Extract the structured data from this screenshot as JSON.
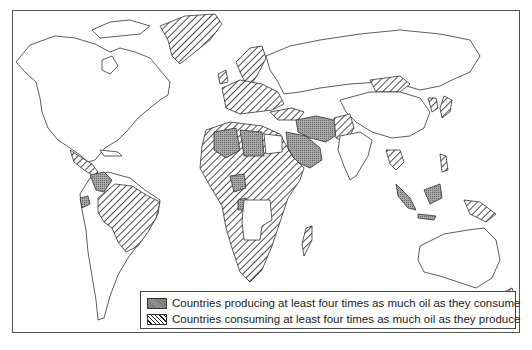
{
  "figure": {
    "type": "world-map",
    "style": "black-and-white outline map with pattern fills"
  },
  "legend": {
    "items": [
      {
        "id": "producer",
        "pattern": "dark-stipple",
        "color": "#9a9a9a",
        "label": "Countries producing at least four times as much oil as they consume"
      },
      {
        "id": "consumer",
        "pattern": "diagonal-hatch",
        "color": "#222222",
        "label": "Countries consuming at least four times as much oil as they produce"
      }
    ]
  },
  "map_regions": {
    "producers": [
      "Venezuela",
      "Ecuador",
      "Algeria",
      "Libya",
      "Nigeria",
      "Gabon",
      "Iraq",
      "Iran",
      "Saudi Arabia",
      "Kuwait",
      "Qatar",
      "UAE",
      "Oman",
      "Indonesia",
      "Brunei",
      "Trinidad"
    ],
    "consumers": [
      "Greenland",
      "Brazil",
      "Central America",
      "Western Europe",
      "Scandinavia",
      "Eastern Europe",
      "Turkey",
      "Afghanistan/Pakistan",
      "Mongolia",
      "Japan",
      "Korea",
      "Philippines",
      "Thailand",
      "Papua New Guinea",
      "New Zealand",
      "Madagascar",
      "Most of sub-Saharan Africa",
      "Sudan",
      "Ethiopia",
      "Morocco",
      "Guianas"
    ]
  }
}
